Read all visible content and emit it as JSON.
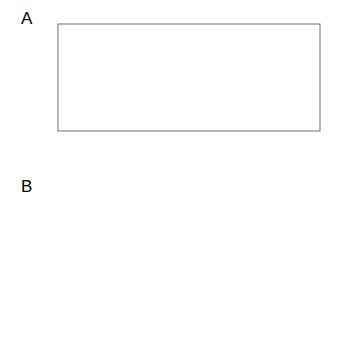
{
  "figure": {
    "panels": [
      {
        "id": "A",
        "letter": "A",
        "ylabel": {
          "prefix": "2",
          "italic": "L",
          "subscript": "−i,R",
          "open": "(",
          "var": "σ",
          "var_sup": "2",
          "sep": " ; ",
          "cond": "ρ̃",
          "comma": ", ",
          "data": "y",
          "close": ")",
          "full": "2L−i,R(σ2 ; ρ̃, y)"
        },
        "xlabel": {
          "var": "σ",
          "sup": "2",
          "full": "σ2"
        },
        "xticks": [
          "0.02",
          "0.03",
          "0.04",
          "0.05",
          "0.06",
          "0.07"
        ],
        "xtick_values": [
          0.02,
          0.03,
          0.04,
          0.05,
          0.06,
          0.07
        ],
        "yticks": [
          "4",
          "2",
          "0",
          "-4",
          "-8"
        ],
        "ytick_values": [
          4,
          2,
          0,
          -4,
          -8
        ],
        "ytick_minor_values": [
          -2,
          -6
        ]
      },
      {
        "id": "B",
        "letter": "B",
        "ylabel": {
          "prefix": "2",
          "italic": "L",
          "subscript": "−i,R",
          "open": "(",
          "var": "ρ",
          "sep": " ; ",
          "cond": "σ̂",
          "cond_sup": "2",
          "comma": ", ",
          "data": "y",
          "close": ")",
          "full": "2L−i,R(ρ ; σ̂2, y)"
        },
        "xlabel": {
          "var": "ρ",
          "full": "ρ"
        },
        "xticks": [
          "-0.4",
          "-0.2",
          "0.0",
          "0.2",
          "0.4",
          "0.6",
          "0.8"
        ],
        "xtick_values": [
          -0.4,
          -0.2,
          0.0,
          0.2,
          0.4,
          0.6,
          0.8
        ],
        "yticks": [
          "4",
          "2",
          "0",
          "-2",
          "-4",
          "-6"
        ],
        "ytick_values": [
          4,
          2,
          0,
          -2,
          -4,
          -6
        ],
        "ytick_minor_values": []
      }
    ]
  },
  "chart_data": [
    {
      "type": "line",
      "panel": "A",
      "title": "",
      "xlabel": "σ2",
      "ylabel": "2L−i,R(σ2 ; ρ̃, y)",
      "xlim": [
        0.0125,
        0.0775
      ],
      "ylim": [
        -9.2,
        4.6
      ],
      "grid": false,
      "legend": "none",
      "series": [
        {
          "name": "restricted profile log-likelihood ratio",
          "x": [
            0.0128,
            0.0135,
            0.0143,
            0.0152,
            0.0162,
            0.0172,
            0.0182,
            0.0193,
            0.0205,
            0.0218,
            0.0232,
            0.0246,
            0.0261,
            0.0276,
            0.0292,
            0.0309,
            0.0326,
            0.0344,
            0.0363,
            0.0383,
            0.0404,
            0.0426,
            0.0449,
            0.0473,
            0.0498,
            0.0524,
            0.0551,
            0.0579,
            0.0608,
            0.0638,
            0.0669,
            0.0701,
            0.0734,
            0.0768
          ],
          "y": [
            -8.45,
            -6.7,
            -5.05,
            -3.6,
            -2.35,
            -1.32,
            -0.48,
            0.25,
            0.92,
            1.53,
            2.07,
            2.52,
            2.9,
            3.21,
            3.47,
            3.67,
            3.8,
            3.86,
            3.86,
            3.8,
            3.68,
            3.5,
            3.26,
            2.96,
            2.6,
            2.18,
            1.7,
            1.16,
            0.58,
            -0.06,
            -0.75,
            -1.48,
            -2.25,
            -3.05
          ]
        }
      ],
      "reference_line": {
        "type": "horizontal",
        "y": 0,
        "style": "dashed"
      },
      "annotations": [
        {
          "type": "point",
          "name": "mle-point",
          "x": 0.0311,
          "y": 3.87,
          "style": "filled-circle"
        },
        {
          "type": "segment",
          "name": "confidence-interval",
          "x_start": 0.0187,
          "x_end": 0.0581,
          "y": 0,
          "style": "thick-solid"
        }
      ]
    },
    {
      "type": "line",
      "panel": "B",
      "title": "",
      "xlabel": "ρ",
      "ylabel": "2L−i,R(ρ ; σ̂2, y)",
      "xlim": [
        -0.52,
        0.94
      ],
      "ylim": [
        -6.9,
        4.6
      ],
      "grid": false,
      "legend": "none",
      "series": [
        {
          "name": "restricted profile log-likelihood ratio",
          "x": [
            -0.5,
            -0.46,
            -0.42,
            -0.38,
            -0.34,
            -0.3,
            -0.26,
            -0.22,
            -0.18,
            -0.14,
            -0.1,
            -0.06,
            -0.02,
            0.02,
            0.06,
            0.1,
            0.14,
            0.18,
            0.22,
            0.26,
            0.3,
            0.34,
            0.38,
            0.42,
            0.46,
            0.5,
            0.54,
            0.58,
            0.62,
            0.66,
            0.7,
            0.74,
            0.78,
            0.82,
            0.86,
            0.9,
            0.93
          ],
          "y": [
            -6.3,
            -5.62,
            -4.97,
            -4.35,
            -3.76,
            -3.2,
            -2.67,
            -2.17,
            -1.7,
            -1.26,
            -0.85,
            -0.47,
            -0.12,
            0.2,
            0.5,
            0.78,
            1.05,
            1.3,
            1.55,
            1.8,
            2.05,
            2.3,
            2.55,
            2.78,
            2.98,
            3.15,
            3.28,
            3.35,
            3.34,
            3.24,
            3.02,
            2.65,
            2.1,
            1.32,
            0.28,
            -1.05,
            -2.2
          ]
        }
      ],
      "reference_line": {
        "type": "horizontal",
        "y": 0,
        "style": "dashed"
      },
      "annotations": [
        {
          "type": "point",
          "name": "mle-point",
          "x": 0.425,
          "y": 3.6,
          "style": "filled-circle"
        },
        {
          "type": "segment",
          "name": "confidence-interval",
          "x_start": -0.083,
          "x_end": 0.793,
          "y": 0,
          "style": "thick-solid"
        }
      ]
    }
  ]
}
